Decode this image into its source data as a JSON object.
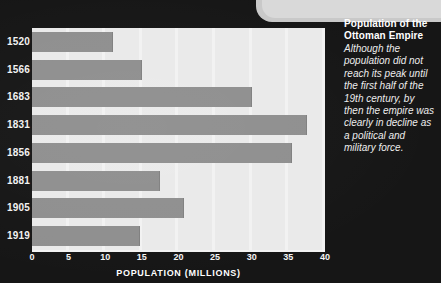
{
  "chart_data": {
    "type": "bar",
    "orientation": "horizontal",
    "title": "Population of the Ottoman Empire",
    "xlabel": "POPULATION (MILLIONS)",
    "ylabel": "",
    "xlim": [
      0,
      40
    ],
    "xticks": [
      0,
      5,
      10,
      15,
      20,
      25,
      30,
      35,
      40
    ],
    "grid": true,
    "legend": false,
    "categories": [
      "1520",
      "1566",
      "1683",
      "1831",
      "1856",
      "1881",
      "1905",
      "1919"
    ],
    "values": [
      11,
      15,
      30,
      37.5,
      35.5,
      17.5,
      20.7,
      14.7
    ],
    "bar_color": "#8f8f8f",
    "plot_background": "#e9e9e9",
    "page_background": "#161616"
  },
  "caption": {
    "title": "Population of the Ottoman Empire",
    "body": "Although the population did not reach its peak until the first half of the 19th century, by then the empire  was clearly in decline as a political and military force."
  },
  "colors": {
    "page_background": "#161616",
    "plot_background": "#e9e9e9",
    "bar": "#8f8f8f",
    "axis": "#f2f2f2",
    "text": "#f0f0f0",
    "deco": "#d9d9d9"
  }
}
